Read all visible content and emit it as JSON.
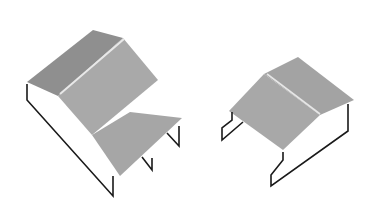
{
  "diagram": {
    "colors": {
      "dark_face": "#8f8f8f",
      "mid_face": "#a6a6a6",
      "light_face": "#b3b3b3",
      "outline": "#1a1a1a",
      "ridge": "#e6e6e6"
    },
    "shapes": [
      {
        "name": "stepped-roof-structure"
      },
      {
        "name": "gable-roof-structure"
      }
    ]
  }
}
